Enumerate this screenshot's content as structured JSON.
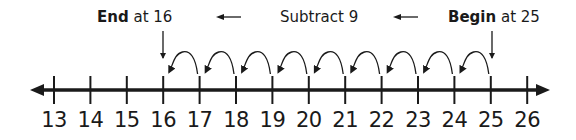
{
  "diagram": {
    "type": "number-line",
    "title": "Subtract 9",
    "start_label": {
      "bold": "Begin",
      "rest": " at 25"
    },
    "end_label": {
      "bold": "End",
      "rest": " at 16"
    },
    "direction_arrows": [
      "left-arrow",
      "left-arrow"
    ],
    "ticks": [
      13,
      14,
      15,
      16,
      17,
      18,
      19,
      20,
      21,
      22,
      23,
      24,
      25,
      26
    ],
    "begin_value": 25,
    "end_value": 16,
    "jumps": [
      {
        "from": 25,
        "to": 24
      },
      {
        "from": 24,
        "to": 23
      },
      {
        "from": 23,
        "to": 22
      },
      {
        "from": 22,
        "to": 21
      },
      {
        "from": 21,
        "to": 20
      },
      {
        "from": 20,
        "to": 19
      },
      {
        "from": 19,
        "to": 18
      },
      {
        "from": 18,
        "to": 17
      },
      {
        "from": 17,
        "to": 16
      }
    ],
    "colors": {
      "ink": "#1a1a1a",
      "background": "#ffffff"
    }
  }
}
